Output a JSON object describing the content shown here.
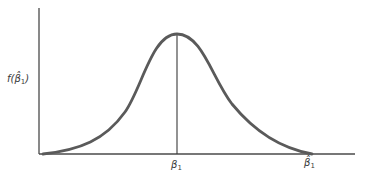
{
  "diagram": {
    "type": "probability-density-curve",
    "y_axis_label": {
      "func": "f(",
      "symbol": "β̂",
      "subscript": "1",
      "close": ")"
    },
    "x_axis_labels": [
      {
        "symbol": "β",
        "subscript": "1",
        "position": "center (true parameter, peak of density)"
      },
      {
        "symbol": "β̂",
        "subscript": "1",
        "position": "right end of axis (estimator)"
      }
    ],
    "curve": "bell-shaped (normal) sampling distribution",
    "colors": {
      "curve": "#5a5a5a",
      "axes": "#4a4a4a",
      "text": "#3a3a3a"
    }
  }
}
